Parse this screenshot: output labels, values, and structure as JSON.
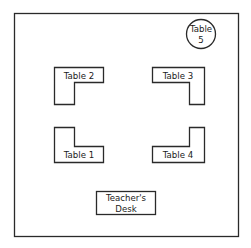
{
  "diagram": {
    "title": "",
    "room": {
      "label": "Classroom"
    },
    "tables": [
      {
        "id": "table-2",
        "label": "Table 2"
      },
      {
        "id": "table-3",
        "label": "Table 3"
      },
      {
        "id": "table-1",
        "label": "Table 1"
      },
      {
        "id": "table-4",
        "label": "Table 4"
      }
    ],
    "round_table": {
      "line1": "Table",
      "line2": "5"
    },
    "teacher_desk": {
      "line1": "Teacher's",
      "line2": "Desk"
    },
    "colors": {
      "stroke": "#2a2a2a",
      "background": "#ffffff",
      "text": "#1a1a1a"
    }
  }
}
